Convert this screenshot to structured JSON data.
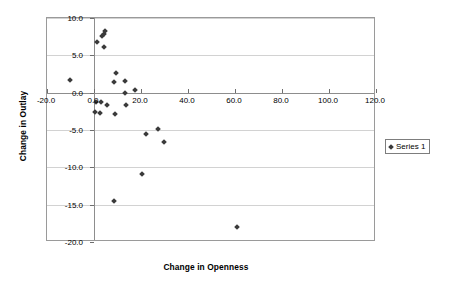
{
  "chart_data": {
    "type": "scatter",
    "title": "",
    "xlabel": "Change in Openness",
    "ylabel": "Change in Outlay",
    "xlim": [
      -20.0,
      120.0
    ],
    "ylim": [
      -20.0,
      10.0
    ],
    "grid": true,
    "legend_position": "right",
    "xticks": [
      "-20.0",
      "0.0",
      "20.0",
      "40.0",
      "60.0",
      "80.0",
      "100.0",
      "120.0"
    ],
    "xtick_values": [
      -20.0,
      0.0,
      20.0,
      40.0,
      60.0,
      80.0,
      100.0,
      120.0
    ],
    "yticks": [
      "10.0",
      "5.0",
      "0.0",
      "-5.0",
      "-10.0",
      "-15.0",
      "-20.0"
    ],
    "ytick_values": [
      10.0,
      5.0,
      0.0,
      -5.0,
      -10.0,
      -15.0,
      -20.0
    ],
    "series": [
      {
        "name": "Series 1",
        "marker": "diamond",
        "color": "#3a3a3a",
        "points": [
          [
            -10.2,
            1.7
          ],
          [
            1.2,
            6.8
          ],
          [
            3.6,
            7.6
          ],
          [
            4.1,
            7.9
          ],
          [
            4.6,
            8.2
          ],
          [
            4.2,
            6.1
          ],
          [
            9.5,
            2.6
          ],
          [
            8.6,
            1.4
          ],
          [
            13.0,
            1.5
          ],
          [
            13.1,
            0.0
          ],
          [
            17.4,
            0.4
          ],
          [
            1.0,
            -1.2
          ],
          [
            3.0,
            -1.2
          ],
          [
            5.4,
            -1.6
          ],
          [
            13.6,
            -1.6
          ],
          [
            0.4,
            -2.6
          ],
          [
            2.6,
            -2.7
          ],
          [
            8.9,
            -2.9
          ],
          [
            27.3,
            -4.9
          ],
          [
            22.0,
            -5.6
          ],
          [
            29.8,
            -6.6
          ],
          [
            20.4,
            -10.9
          ],
          [
            8.5,
            -14.5
          ],
          [
            61.0,
            -18.0
          ]
        ]
      }
    ]
  },
  "legend": {
    "entries": [
      {
        "label": "Series 1",
        "marker": "diamond-marker-icon"
      }
    ]
  }
}
